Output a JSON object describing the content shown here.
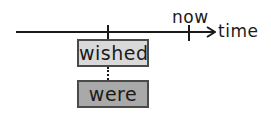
{
  "diagram": {
    "type": "timeline",
    "axis": {
      "label": "time",
      "direction": "right"
    },
    "markers": {
      "past_tick": "",
      "now_label": "now"
    },
    "boxes": {
      "upper": {
        "label": "wished",
        "fill": "#d9d9d9"
      },
      "lower": {
        "label": "were",
        "fill": "#a9a9a9"
      }
    },
    "connector": {
      "style": "dotted"
    },
    "colors": {
      "line": "#1a1a1a",
      "border": "#4a4a4a"
    }
  }
}
